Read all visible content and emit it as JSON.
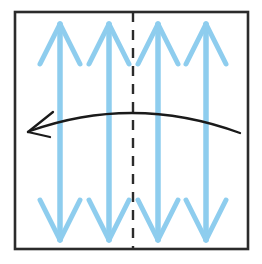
{
  "figure": {
    "canvas": {
      "width": 262,
      "height": 264,
      "background": "#ffffff"
    },
    "frame": {
      "name": "outer-square-frame",
      "x": 15,
      "y": 12,
      "width": 233,
      "height": 237,
      "stroke": "#2b2b2b",
      "stroke_width": 2.6,
      "fill": "none"
    },
    "mirror_line": {
      "name": "vertical-dashed-mirror-line",
      "x": 133,
      "y_top": 12,
      "y_bottom": 249,
      "stroke": "#2b2b2b",
      "stroke_width": 2.4,
      "dash_pattern": "10 8"
    },
    "arrow_color": "#8ECDEE",
    "arrow_shaft_width": 5.5,
    "arrow_head_width": 5.0,
    "double_arrows": [
      {
        "label": "double-arrow-1",
        "x": 60,
        "y_top": 24,
        "y_bottom": 240,
        "head_half_span": 20,
        "head_length": 40
      },
      {
        "label": "double-arrow-2",
        "x": 109,
        "y_top": 24,
        "y_bottom": 240,
        "head_half_span": 20,
        "head_length": 40
      },
      {
        "label": "double-arrow-3",
        "x": 158,
        "y_top": 24,
        "y_bottom": 240,
        "head_half_span": 20,
        "head_length": 40
      },
      {
        "label": "double-arrow-4",
        "x": 206,
        "y_top": 24,
        "y_bottom": 240,
        "head_half_span": 20,
        "head_length": 40
      }
    ],
    "curved_arrow": {
      "name": "curved-rotation-arrow",
      "direction": "leftward",
      "stroke": "#1a1a1a",
      "stroke_width": 2.3,
      "start_x": 240,
      "start_y": 133,
      "control_x": 134,
      "control_y": 94,
      "end_x": 30,
      "end_y": 131,
      "head_tip_x": 28,
      "head_tip_y": 132,
      "head_upper_x": 53,
      "head_upper_y": 112,
      "head_lower_x": 50,
      "head_lower_y": 137
    }
  }
}
